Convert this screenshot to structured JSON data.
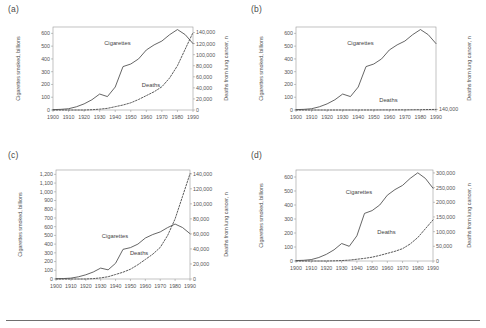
{
  "figure": {
    "panels": [
      {
        "key": "a",
        "label": "(a)",
        "left_axis_title": "Cigarettes smoked, billions",
        "right_axis_title": "Deaths from lung cancer, n",
        "left_ticks": [
          "600",
          "500",
          "400",
          "300",
          "200",
          "100",
          "0"
        ],
        "left_values": [
          600,
          500,
          400,
          300,
          200,
          100,
          0
        ],
        "right_ticks": [
          "140,000",
          "120,000",
          "100,000",
          "80,000",
          "60,000",
          "40,000",
          "20,000",
          "0"
        ],
        "right_values": [
          140000,
          120000,
          100000,
          80000,
          60000,
          40000,
          20000,
          0
        ],
        "x_ticks": [
          "1900",
          "1910",
          "1920",
          "1930",
          "1940",
          "1950",
          "1960",
          "1970",
          "1980",
          "1990"
        ],
        "series_labels": {
          "cigarettes": "Cigarettes",
          "deaths": "Deaths"
        }
      },
      {
        "key": "b",
        "label": "(b)",
        "left_axis_title": "Cigarettes smoked, billions",
        "right_axis_title": "Deaths from lung cancer, n",
        "left_ticks": [
          "600",
          "500",
          "400",
          "300",
          "200",
          "100",
          "0"
        ],
        "left_values": [
          600,
          500,
          400,
          300,
          200,
          100,
          0
        ],
        "right_ticks": [
          "140,000"
        ],
        "right_values": [
          140000
        ],
        "x_ticks": [
          "1900",
          "1910",
          "1920",
          "1930",
          "1940",
          "1950",
          "1960",
          "1970",
          "1980",
          "1990"
        ],
        "series_labels": {
          "cigarettes": "Cigarettes",
          "deaths": "Deaths"
        }
      },
      {
        "key": "c",
        "label": "(c)",
        "left_axis_title": "Cigarettes smoked, billions",
        "right_axis_title": "Deaths from lung cancer, n",
        "left_ticks": [
          "1,200",
          "1,100",
          "1,000",
          "900",
          "800",
          "700",
          "600",
          "500",
          "400",
          "300",
          "200",
          "100",
          "0"
        ],
        "left_values": [
          1200,
          1100,
          1000,
          900,
          800,
          700,
          600,
          500,
          400,
          300,
          200,
          100,
          0
        ],
        "right_ticks": [
          "140,000",
          "120,000",
          "100,000",
          "80,000",
          "60,000",
          "40,000",
          "20,000",
          "0"
        ],
        "right_values": [
          140000,
          120000,
          100000,
          80000,
          60000,
          40000,
          20000,
          0
        ],
        "x_ticks": [
          "1900",
          "1910",
          "1920",
          "1930",
          "1940",
          "1950",
          "1960",
          "1970",
          "1980",
          "1990"
        ],
        "series_labels": {
          "cigarettes": "Cigarettes",
          "deaths": "Deaths"
        }
      },
      {
        "key": "d",
        "label": "(d)",
        "left_axis_title": "Cigarettes smoked, billions",
        "right_axis_title": "Deaths from lung cancer, n",
        "left_ticks": [
          "600",
          "500",
          "400",
          "300",
          "200",
          "100",
          "0"
        ],
        "left_values": [
          600,
          500,
          400,
          300,
          200,
          100,
          0
        ],
        "right_ticks": [
          "300,000",
          "250,000",
          "200,000",
          "150,000",
          "100,000",
          "50,000",
          "0"
        ],
        "right_values": [
          300000,
          250000,
          200000,
          150000,
          100000,
          50000,
          0
        ],
        "x_ticks": [
          "1900",
          "1910",
          "1920",
          "1930",
          "1940",
          "1950",
          "1960",
          "1970",
          "1980",
          "1990"
        ],
        "series_labels": {
          "cigarettes": "Cigarettes",
          "deaths": "Deaths"
        }
      }
    ]
  },
  "chart_data": [
    {
      "type": "line",
      "panel": "a",
      "title": "(a)",
      "xlabel": "",
      "ylabel": "Cigarettes smoked, billions",
      "y2label": "Deaths from lung cancer, n",
      "xlim": [
        1900,
        1990
      ],
      "ylim": [
        0,
        650
      ],
      "y2lim": [
        0,
        150000
      ],
      "grid": false,
      "legend": "inline-annotation",
      "x": [
        1900,
        1905,
        1910,
        1915,
        1920,
        1925,
        1930,
        1935,
        1940,
        1945,
        1950,
        1955,
        1960,
        1965,
        1970,
        1975,
        1980,
        1985,
        1990
      ],
      "series": [
        {
          "name": "Cigarettes",
          "axis": "left",
          "style": "solid",
          "values": [
            3,
            5,
            10,
            25,
            48,
            80,
            125,
            105,
            180,
            340,
            360,
            400,
            470,
            510,
            540,
            590,
            630,
            590,
            520
          ]
        },
        {
          "name": "Deaths",
          "axis": "right",
          "style": "dashed",
          "values": [
            0,
            0,
            0,
            0,
            0,
            500,
            1500,
            3000,
            6000,
            9000,
            13000,
            19000,
            26000,
            33000,
            42000,
            58000,
            80000,
            110000,
            140000
          ]
        }
      ]
    },
    {
      "type": "line",
      "panel": "b",
      "title": "(b)",
      "xlabel": "",
      "ylabel": "Cigarettes smoked, billions",
      "y2label": "Deaths from lung cancer, n",
      "xlim": [
        1900,
        1990
      ],
      "ylim": [
        0,
        650
      ],
      "y2lim": [
        0,
        20000000
      ],
      "grid": false,
      "legend": "inline-annotation",
      "x": [
        1900,
        1905,
        1910,
        1915,
        1920,
        1925,
        1930,
        1935,
        1940,
        1945,
        1950,
        1955,
        1960,
        1965,
        1970,
        1975,
        1980,
        1985,
        1990
      ],
      "series": [
        {
          "name": "Cigarettes",
          "axis": "left",
          "style": "solid",
          "values": [
            3,
            5,
            10,
            25,
            48,
            80,
            125,
            105,
            180,
            340,
            360,
            400,
            470,
            510,
            540,
            590,
            630,
            590,
            520
          ]
        },
        {
          "name": "Deaths",
          "axis": "right",
          "style": "dashed",
          "values": [
            0,
            0,
            0,
            0,
            0,
            500,
            1500,
            3000,
            6000,
            9000,
            13000,
            19000,
            26000,
            33000,
            42000,
            58000,
            80000,
            110000,
            140000
          ]
        }
      ]
    },
    {
      "type": "line",
      "panel": "c",
      "title": "(c)",
      "xlabel": "",
      "ylabel": "Cigarettes smoked, billions",
      "y2label": "Deaths from lung cancer, n",
      "xlim": [
        1900,
        1990
      ],
      "ylim": [
        0,
        1250
      ],
      "y2lim": [
        0,
        145000
      ],
      "grid": false,
      "legend": "inline-annotation",
      "x": [
        1900,
        1905,
        1910,
        1915,
        1920,
        1925,
        1930,
        1935,
        1940,
        1945,
        1950,
        1955,
        1960,
        1965,
        1970,
        1975,
        1980,
        1985,
        1990
      ],
      "series": [
        {
          "name": "Cigarettes",
          "axis": "left",
          "style": "solid",
          "values": [
            3,
            5,
            10,
            25,
            48,
            80,
            125,
            105,
            180,
            340,
            360,
            400,
            470,
            510,
            540,
            590,
            630,
            590,
            520
          ]
        },
        {
          "name": "Deaths",
          "axis": "right",
          "style": "dashed",
          "values": [
            0,
            0,
            0,
            0,
            0,
            500,
            1500,
            3000,
            6000,
            9000,
            13000,
            19000,
            26000,
            33000,
            42000,
            58000,
            80000,
            110000,
            140000
          ]
        }
      ]
    },
    {
      "type": "line",
      "panel": "d",
      "title": "(d)",
      "xlabel": "",
      "ylabel": "Cigarettes smoked, billions",
      "y2label": "Deaths from lung cancer, n",
      "xlim": [
        1900,
        1990
      ],
      "ylim": [
        0,
        650
      ],
      "y2lim": [
        0,
        310000
      ],
      "grid": false,
      "legend": "inline-annotation",
      "x": [
        1900,
        1905,
        1910,
        1915,
        1920,
        1925,
        1930,
        1935,
        1940,
        1945,
        1950,
        1955,
        1960,
        1965,
        1970,
        1975,
        1980,
        1985,
        1990
      ],
      "series": [
        {
          "name": "Cigarettes",
          "axis": "left",
          "style": "solid",
          "values": [
            3,
            5,
            10,
            25,
            48,
            80,
            125,
            105,
            180,
            340,
            360,
            400,
            470,
            510,
            540,
            590,
            630,
            590,
            520
          ]
        },
        {
          "name": "Deaths",
          "axis": "right",
          "style": "dashed",
          "values": [
            0,
            0,
            0,
            0,
            0,
            500,
            1500,
            3000,
            6000,
            9000,
            13000,
            19000,
            26000,
            33000,
            42000,
            58000,
            80000,
            110000,
            140000
          ]
        }
      ]
    }
  ]
}
